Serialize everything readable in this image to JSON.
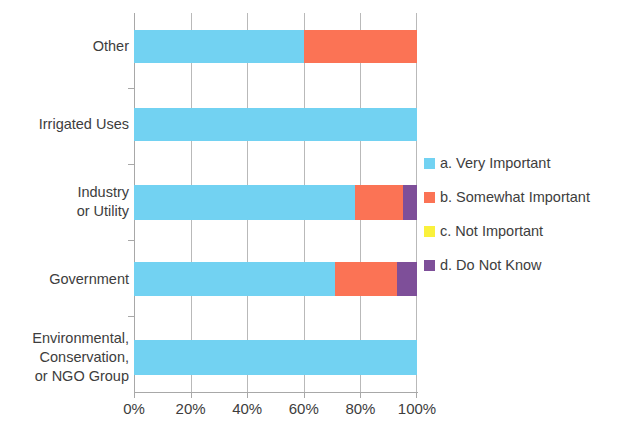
{
  "chart_data": {
    "type": "bar",
    "orientation": "horizontal",
    "stacked": true,
    "normalized_percent": true,
    "title": "",
    "subtitle": "",
    "xlabel": "",
    "ylabel": "",
    "xlim": [
      0,
      100
    ],
    "xticks": [
      0,
      20,
      40,
      60,
      80,
      100
    ],
    "xtick_labels": [
      "0%",
      "20%",
      "40%",
      "60%",
      "80%",
      "100%"
    ],
    "grid": "vertical",
    "legend_position": "right",
    "categories": [
      "Other",
      "Irrigated Uses",
      "Industry\nor Utility",
      "Government",
      "Environmental,\nConservation,\nor NGO Group"
    ],
    "series": [
      {
        "name": "a. Very Important",
        "color": "#72D2F2",
        "values": [
          60,
          100,
          78,
          71,
          100
        ]
      },
      {
        "name": "b. Somewhat Important",
        "color": "#FB7355",
        "values": [
          40,
          0,
          17,
          22,
          0
        ]
      },
      {
        "name": "c. Not Important",
        "color": "#FAF13C",
        "values": [
          0,
          0,
          0,
          0,
          0
        ]
      },
      {
        "name": "d. Do Not Know",
        "color": "#7E4F99",
        "values": [
          0,
          0,
          5,
          7,
          0
        ]
      }
    ]
  },
  "legend": {
    "items": [
      {
        "label": "a. Very Important",
        "color": "#72D2F2"
      },
      {
        "label": "b. Somewhat Important",
        "color": "#FB7355"
      },
      {
        "label": "c. Not Important",
        "color": "#FAF13C"
      },
      {
        "label": "d. Do Not Know",
        "color": "#7E4F99"
      }
    ]
  },
  "axis": {
    "x_tick_labels": [
      "0%",
      "20%",
      "40%",
      "60%",
      "80%",
      "100%"
    ],
    "y_tick_labels": [
      "Other",
      "Irrigated Uses",
      "Industry\nor Utility",
      "Government",
      "Environmental,\nConservation,\nor NGO Group"
    ]
  }
}
